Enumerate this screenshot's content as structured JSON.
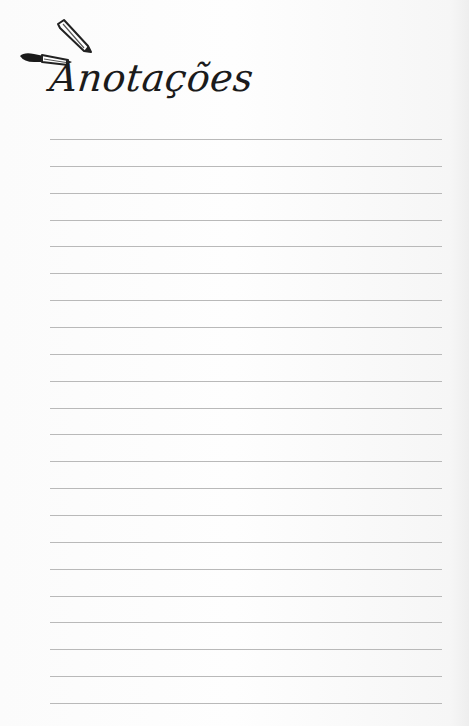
{
  "page": {
    "title": "Anotações",
    "icons": [
      "pencil-icon",
      "pen-icon"
    ],
    "line_color": "#b9b9b9",
    "line_count": 22
  }
}
